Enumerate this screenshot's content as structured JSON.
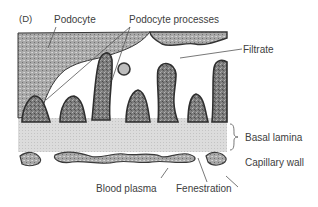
{
  "figure": {
    "panel_letter": "(D)",
    "labels": {
      "podocyte": "Podocyte",
      "podocyte_processes": "Podocyte processes",
      "filtrate": "Filtrate",
      "basal_lamina": "Basal lamina",
      "capillary_wall": "Capillary wall",
      "blood_plasma": "Blood plasma",
      "fenestration": "Fenestration"
    },
    "colors": {
      "background": "#ffffff",
      "tissue_dark": "#3c3c3c",
      "tissue_mid": "#8a8a8a",
      "lamina": "#d9d9d9",
      "leader_line": "#555555"
    }
  }
}
